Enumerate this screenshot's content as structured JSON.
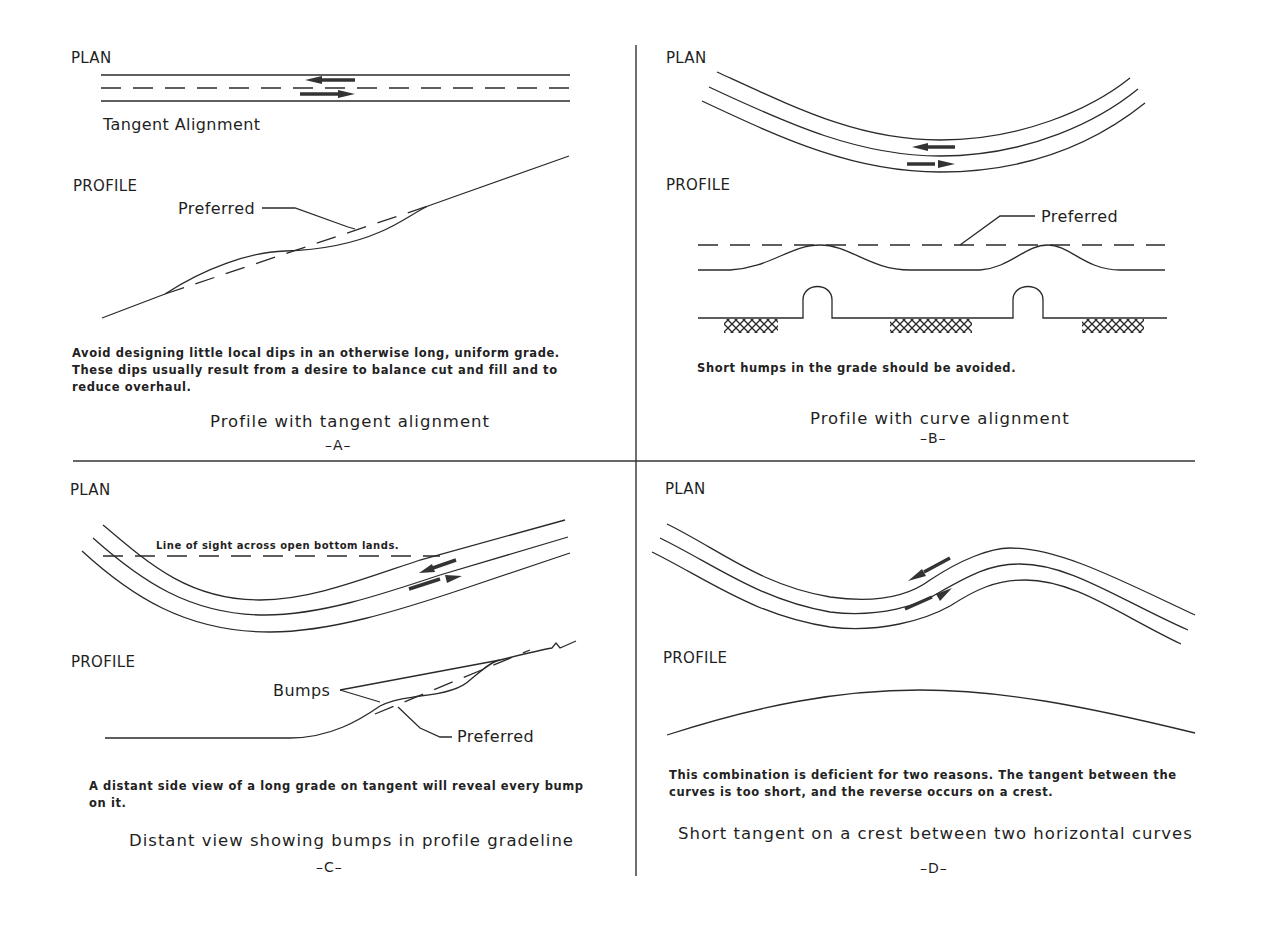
{
  "figure": {
    "panels": [
      {
        "id": "A",
        "plan_label": "PLAN",
        "plan_caption": "Tangent Alignment",
        "profile_label": "PROFILE",
        "callouts": [
          "Preferred"
        ],
        "note": "Avoid designing little local dips in an otherwise long, uniform grade. These dips usually result from a desire to balance cut and fill and to reduce overhaul.",
        "title": "Profile with tangent alignment",
        "letter": "–A–"
      },
      {
        "id": "B",
        "plan_label": "PLAN",
        "profile_label": "PROFILE",
        "callouts": [
          "Preferred"
        ],
        "note": "Short humps in the grade should be avoided.",
        "title": "Profile with curve alignment",
        "letter": "–B–"
      },
      {
        "id": "C",
        "plan_label": "PLAN",
        "plan_annotation": "Line of sight across open bottom lands.",
        "profile_label": "PROFILE",
        "callouts": [
          "Bumps",
          "Preferred"
        ],
        "note": "A distant side view of a long grade on tangent will reveal every bump on it.",
        "title": "Distant view showing bumps in profile gradeline",
        "letter": "–C–"
      },
      {
        "id": "D",
        "plan_label": "PLAN",
        "profile_label": "PROFILE",
        "callouts": [],
        "note": "This combination is deficient for two reasons.  The tangent between the curves is too short, and the reverse occurs on a crest.",
        "title": "Short tangent on a crest between two horizontal curves",
        "letter": "–D–"
      }
    ]
  },
  "icons": {
    "direction_arrows": "traffic-direction-arrows",
    "hatch": "earth-hatch-pattern",
    "culvert": "culvert-hump"
  },
  "colors": {
    "ink": "#2a2a2a",
    "background": "#ffffff"
  }
}
